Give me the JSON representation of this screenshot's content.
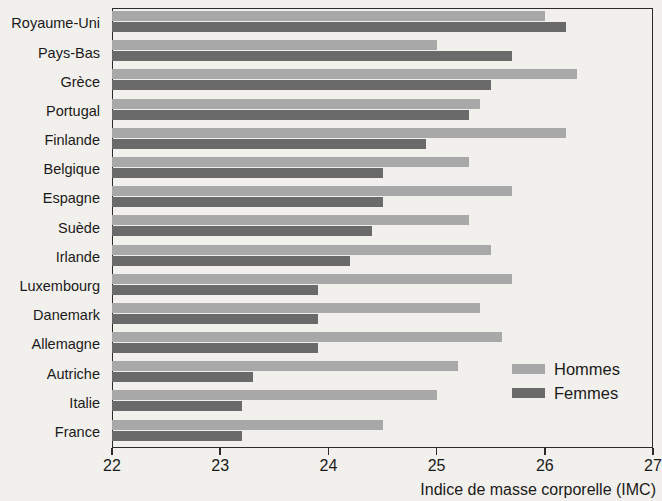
{
  "chart_data": {
    "type": "bar",
    "orientation": "horizontal",
    "title": "",
    "xlabel": "Indice de masse corporelle (IMC)",
    "ylabel": "",
    "xlim": [
      22,
      27
    ],
    "xticks": [
      22,
      23,
      24,
      25,
      26,
      27
    ],
    "xticklabels": [
      "22",
      "23",
      "24",
      "25",
      "26",
      "27"
    ],
    "grid": false,
    "legend_position": "inside-bottom-right",
    "categories": [
      "Royaume-Uni",
      "Pays-Bas",
      "Grèce",
      "Portugal",
      "Finlande",
      "Belgique",
      "Espagne",
      "Suède",
      "Irlande",
      "Luxembourg",
      "Danemark",
      "Allemagne",
      "Autriche",
      "Italie",
      "France"
    ],
    "series": [
      {
        "name": "Hommes",
        "color": "#a8a8a8",
        "values": [
          26.0,
          25.0,
          26.3,
          25.4,
          26.2,
          25.3,
          25.7,
          25.3,
          25.5,
          25.7,
          25.4,
          25.6,
          25.2,
          25.0,
          24.5
        ]
      },
      {
        "name": "Femmes",
        "color": "#6a6a6a",
        "values": [
          26.2,
          25.7,
          25.5,
          25.3,
          24.9,
          24.5,
          24.5,
          24.4,
          24.2,
          23.9,
          23.9,
          23.9,
          23.3,
          23.2,
          23.2
        ]
      }
    ]
  },
  "legend": {
    "items": [
      {
        "label": "Hommes"
      },
      {
        "label": "Femmes"
      }
    ]
  },
  "colors": {
    "hommes": "#a8a8a8",
    "femmes": "#6a6a6a",
    "axis": "#2b2b2b",
    "background": "#f2f0ec"
  }
}
